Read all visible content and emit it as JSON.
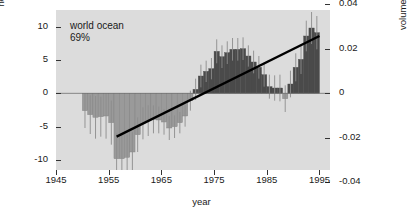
{
  "chart_data": {
    "type": "bar",
    "title": "",
    "subtitle": "",
    "xlabel": "year",
    "ylabel": "heat content, ×10²² J",
    "ylabel_right": "volume mean temperature anomaly, °C",
    "xlim": [
      1945,
      1997
    ],
    "ylim": [
      -11.5,
      12.5
    ],
    "ylim_right": [
      -0.0345,
      0.0375
    ],
    "xticks": [
      1945,
      1955,
      1965,
      1975,
      1985,
      1995
    ],
    "xticklabels": [
      "1945",
      "1955",
      "1965",
      "1975",
      "1985",
      "1995"
    ],
    "yticks": [
      10,
      5,
      0,
      -5,
      -10
    ],
    "yticklabels": [
      "10",
      "5",
      "0",
      "-5",
      "-10"
    ],
    "yticks_right": [
      0.04,
      0.02,
      0,
      -0.02,
      -0.04
    ],
    "yticklabels_right": [
      "0.04",
      "0.02",
      "0",
      "-0.02",
      "-0.04"
    ],
    "grid": false,
    "legend": false,
    "annotations": [
      "world ocean",
      "69%"
    ],
    "colors": {
      "plot_background": "#dcdcdc",
      "bar_negative": "#9a9a9a",
      "bar_positive": "#4a4a4a",
      "errorbar": "#8c8c8c",
      "trendline": "#000000",
      "axis": "#333333",
      "text": "#1a1a1a",
      "figure_background": "#ffffff"
    },
    "x": [
      1950,
      1951,
      1952,
      1953,
      1954,
      1955,
      1956,
      1957,
      1958,
      1959,
      1960,
      1961,
      1962,
      1963,
      1964,
      1965,
      1966,
      1967,
      1968,
      1969,
      1970,
      1971,
      1972,
      1973,
      1974,
      1975,
      1976,
      1977,
      1978,
      1979,
      1980,
      1981,
      1982,
      1983,
      1984,
      1985,
      1986,
      1987,
      1988,
      1989,
      1990,
      1991,
      1992,
      1993,
      1994
    ],
    "values": [
      -2.6,
      -3.2,
      -3.6,
      -3.5,
      -3.4,
      -4.4,
      -9.8,
      -9.8,
      -9.6,
      -8.8,
      -6.2,
      -4.5,
      -4.1,
      -3.9,
      -4.0,
      -4.3,
      -5.2,
      -5.0,
      -4.4,
      -3.4,
      -1.1,
      0.6,
      2.6,
      3.3,
      3.7,
      6.3,
      5.5,
      6.1,
      6.6,
      6.6,
      6.7,
      5.6,
      4.7,
      3.9,
      2.8,
      1.0,
      0.8,
      0.8,
      -0.8,
      1.4,
      3.9,
      5.1,
      8.6,
      9.8,
      9.1
    ],
    "errors": [
      2.6,
      2.9,
      3.2,
      3.0,
      3.4,
      3.3,
      3.8,
      3.6,
      3.4,
      3.0,
      2.6,
      2.4,
      2.3,
      2.1,
      2.0,
      1.9,
      1.8,
      1.7,
      1.6,
      1.6,
      1.5,
      1.6,
      1.7,
      1.6,
      1.6,
      1.8,
      1.7,
      1.7,
      1.7,
      1.7,
      1.7,
      1.6,
      1.7,
      1.7,
      1.8,
      1.8,
      1.9,
      2.0,
      2.0,
      2.0,
      2.1,
      2.2,
      2.3,
      2.4,
      2.5
    ],
    "trendline": {
      "x": [
        1956.5,
        1995.0
      ],
      "y": [
        -6.5,
        8.6
      ]
    }
  },
  "labels": {
    "annotation_line1": "world ocean",
    "annotation_line2": "69%",
    "xaxis_title": "year",
    "yaxis_left_title": "heat content, ×10²² J",
    "yaxis_right_title": "volume mean temperature anomaly, °C"
  }
}
